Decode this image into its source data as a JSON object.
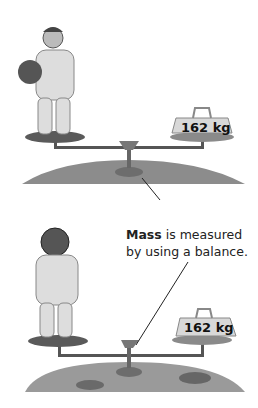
{
  "caption": {
    "bold": "Mass",
    "rest_line1": " is measured",
    "line2": "by using a balance."
  },
  "scenes": [
    {
      "name": "earth",
      "astronaut": "helmet-held",
      "weight_label": "162 kg",
      "ground": "grassy"
    },
    {
      "name": "moon",
      "astronaut": "helmet-on",
      "weight_label": "162 kg",
      "ground": "cratered"
    }
  ]
}
